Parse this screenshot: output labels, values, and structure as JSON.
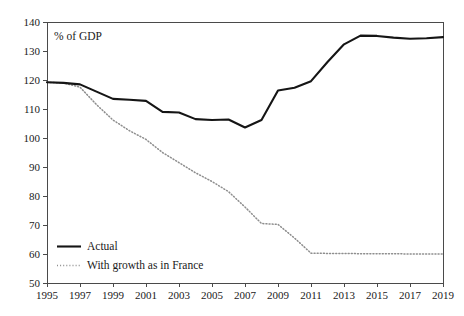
{
  "chart_data": {
    "type": "line",
    "title": "",
    "xlabel": "",
    "ylabel": "",
    "axis_note": "% of GDP",
    "grid": false,
    "legend_position": "bottom-left",
    "xlim": [
      1995,
      2019
    ],
    "ylim": [
      50,
      140
    ],
    "x": [
      1995,
      1996,
      1997,
      1998,
      1999,
      2000,
      2001,
      2002,
      2003,
      2004,
      2005,
      2006,
      2007,
      2008,
      2009,
      2010,
      2011,
      2012,
      2013,
      2014,
      2015,
      2016,
      2017,
      2018,
      2019
    ],
    "x_tick_labels": [
      "1995",
      "1997",
      "1999",
      "2001",
      "2003",
      "2005",
      "2007",
      "2009",
      "2011",
      "2013",
      "2015",
      "2017",
      "2019"
    ],
    "x_ticks": [
      1995,
      1997,
      1999,
      2001,
      2003,
      2005,
      2007,
      2009,
      2011,
      2013,
      2015,
      2017,
      2019
    ],
    "y_ticks": [
      50,
      60,
      70,
      80,
      90,
      100,
      110,
      120,
      130,
      140
    ],
    "y_tick_labels": [
      "50",
      "60",
      "70",
      "80",
      "90",
      "100",
      "110",
      "120",
      "130",
      "140"
    ],
    "series": [
      {
        "name": "Actual",
        "style": "solid",
        "color": "#151515",
        "values": [
          119.2,
          119.0,
          118.5,
          116.0,
          113.5,
          113.2,
          112.8,
          109.0,
          108.8,
          106.5,
          106.2,
          106.4,
          103.6,
          106.2,
          116.4,
          117.3,
          119.6,
          126.2,
          132.3,
          135.3,
          135.2,
          134.6,
          134.2,
          134.4,
          134.8
        ]
      },
      {
        "name": "With growth as in France",
        "style": "dotted",
        "color": "#8e8e8e",
        "values": [
          119.2,
          119.0,
          117.5,
          111.5,
          106.2,
          102.5,
          99.5,
          95.0,
          91.5,
          88.0,
          85.0,
          81.5,
          76.2,
          70.5,
          70.2,
          65.5,
          60.3,
          60.2,
          60.2,
          60.1,
          60.1,
          60.1,
          60.0,
          60.0,
          60.0
        ]
      }
    ]
  },
  "legend": {
    "items": [
      {
        "label": "Actual",
        "style": "solid"
      },
      {
        "label": "With growth as in France",
        "style": "dotted"
      }
    ]
  }
}
